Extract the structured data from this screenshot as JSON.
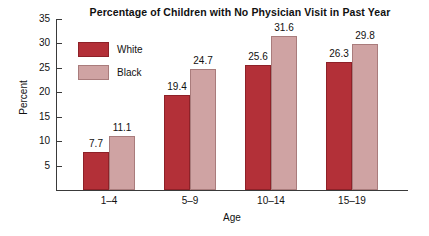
{
  "chart_data": {
    "type": "bar",
    "title": "Percentage of Children with No Physician Visit in Past Year",
    "xlabel": "Age",
    "ylabel": "Percent",
    "categories": [
      "1–4",
      "5–9",
      "10–14",
      "15–19"
    ],
    "series": [
      {
        "name": "White",
        "color": "#b33038",
        "values": [
          7.7,
          19.4,
          25.6,
          26.3
        ]
      },
      {
        "name": "Black",
        "color": "#cfa3a3",
        "values": [
          11.1,
          24.7,
          31.6,
          29.8
        ]
      }
    ],
    "value_labels": [
      [
        "7.7",
        "11.1"
      ],
      [
        "19.4",
        "24.7"
      ],
      [
        "25.6",
        "31.6"
      ],
      [
        "26.3",
        "29.8"
      ]
    ],
    "ylim": [
      0,
      35
    ],
    "ytick_values": [
      5,
      10,
      15,
      20,
      25,
      30,
      35
    ],
    "ytick_labels": [
      "5",
      "10",
      "15",
      "20",
      "25",
      "30",
      "35"
    ],
    "grid": false,
    "legend_position": "upper-left-inside"
  },
  "legend": {
    "items": [
      {
        "label": "White"
      },
      {
        "label": "Black"
      }
    ]
  }
}
